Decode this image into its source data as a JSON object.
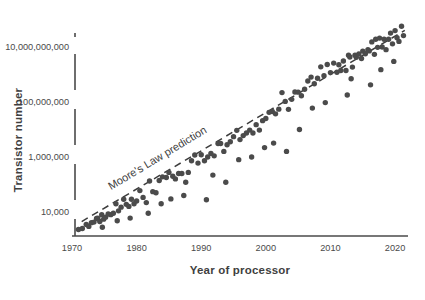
{
  "chart_data": {
    "type": "scatter",
    "title": "",
    "xlabel": "Year of processor",
    "ylabel": "Transistor number",
    "xlim": [
      1970,
      2022
    ],
    "ylim": [
      2000,
      50000000000
    ],
    "yscale": "log",
    "xticks": [
      "1970",
      "1980",
      "1990",
      "2000",
      "2010",
      "2020"
    ],
    "xtick_values": [
      1970,
      1980,
      1990,
      2000,
      2010,
      2020
    ],
    "yticks": [
      "10,000",
      "1,000,000",
      "100,000,000",
      "10,000,000,000"
    ],
    "ytick_values": [
      10000,
      1000000,
      100000000,
      10000000000
    ],
    "grid": false,
    "legend": "none",
    "point_color": "#4b4b4b",
    "point_size": 5.4,
    "annotations": [
      {
        "text": "Moore's Law prediction",
        "x": 1983.5,
        "y": 700000,
        "rotation": -31
      }
    ],
    "series": [
      {
        "name": "Moore's Law prediction",
        "type": "line",
        "style": "dashed",
        "color": "#3c3c3c",
        "x": [
          1971.5,
          2021.5
        ],
        "y": [
          4500,
          40000000000
        ]
      },
      {
        "name": "Processors",
        "type": "scatter",
        "color": "#4b4b4b",
        "points": [
          [
            1971.0,
            2300
          ],
          [
            1971.6,
            2500
          ],
          [
            1972.2,
            3500
          ],
          [
            1972.6,
            3000
          ],
          [
            1973.0,
            4100
          ],
          [
            1973.4,
            4300
          ],
          [
            1973.8,
            5800
          ],
          [
            1974.0,
            6000
          ],
          [
            1974.3,
            4500
          ],
          [
            1974.6,
            8000
          ],
          [
            1974.9,
            5500
          ],
          [
            1975.2,
            6500
          ],
          [
            1975.6,
            8500
          ],
          [
            1976.0,
            8000
          ],
          [
            1976.4,
            9000
          ],
          [
            1976.8,
            20000
          ],
          [
            1977.2,
            11000
          ],
          [
            1977.6,
            15000
          ],
          [
            1978.0,
            29000
          ],
          [
            1978.4,
            19000
          ],
          [
            1978.8,
            16000
          ],
          [
            1979.2,
            29000
          ],
          [
            1979.6,
            20000
          ],
          [
            1980.0,
            25000
          ],
          [
            1980.5,
            60000
          ],
          [
            1981.0,
            34000
          ],
          [
            1981.5,
            22000
          ],
          [
            1982.0,
            134000
          ],
          [
            1982.5,
            55000
          ],
          [
            1983.0,
            50000
          ],
          [
            1983.5,
            140000
          ],
          [
            1984.0,
            190000
          ],
          [
            1984.6,
            180000
          ],
          [
            1985.0,
            275000
          ],
          [
            1985.6,
            200000
          ],
          [
            1986.0,
            160000
          ],
          [
            1986.5,
            250000
          ],
          [
            1987.0,
            250000
          ],
          [
            1987.6,
            120000
          ],
          [
            1988.0,
            275000
          ],
          [
            1988.5,
            730000
          ],
          [
            1989.0,
            1180000
          ],
          [
            1989.5,
            600000
          ],
          [
            1990.0,
            1200000
          ],
          [
            1990.5,
            730000
          ],
          [
            1991.0,
            1000000
          ],
          [
            1991.5,
            1350000
          ],
          [
            1992.0,
            1100000
          ],
          [
            1992.6,
            3100000
          ],
          [
            1993.0,
            3100000
          ],
          [
            1993.5,
            1600000
          ],
          [
            1994.0,
            2800000
          ],
          [
            1994.5,
            3600000
          ],
          [
            1995.0,
            5500000
          ],
          [
            1995.5,
            9300000
          ],
          [
            1996.0,
            4300000
          ],
          [
            1996.5,
            6000000
          ],
          [
            1997.0,
            7500000
          ],
          [
            1997.5,
            9500000
          ],
          [
            1998.0,
            7500000
          ],
          [
            1998.5,
            15000000
          ],
          [
            1999.0,
            9500000
          ],
          [
            1999.5,
            21000000
          ],
          [
            2000.0,
            25000000
          ],
          [
            2000.5,
            42000000
          ],
          [
            2001.0,
            45000000
          ],
          [
            2001.5,
            37000000
          ],
          [
            2002.0,
            55000000
          ],
          [
            2002.5,
            220000000
          ],
          [
            2003.0,
            105000000
          ],
          [
            2003.5,
            54000000
          ],
          [
            2004.0,
            125000000
          ],
          [
            2004.5,
            230000000
          ],
          [
            2005.0,
            228000000
          ],
          [
            2005.5,
            169000000
          ],
          [
            2006.0,
            291000000
          ],
          [
            2006.5,
            582000000
          ],
          [
            2007.0,
            805000000
          ],
          [
            2007.5,
            463000000
          ],
          [
            2008.0,
            731000000
          ],
          [
            2008.5,
            1900000000
          ],
          [
            2009.0,
            904000000
          ],
          [
            2009.5,
            2300000000
          ],
          [
            2010.0,
            1170000000
          ],
          [
            2010.5,
            2600000000
          ],
          [
            2011.0,
            1200000000
          ],
          [
            2011.3,
            2270000000
          ],
          [
            2011.6,
            1400000000
          ],
          [
            2012.0,
            3100000000
          ],
          [
            2012.4,
            1400000000
          ],
          [
            2012.8,
            5000000000
          ],
          [
            2013.0,
            4310000000
          ],
          [
            2013.4,
            1860000000
          ],
          [
            2013.8,
            5000000000
          ],
          [
            2014.0,
            4200000000
          ],
          [
            2014.4,
            5560000000
          ],
          [
            2014.8,
            3800000000
          ],
          [
            2015.0,
            7100000000
          ],
          [
            2015.4,
            5700000000
          ],
          [
            2015.8,
            8000000000
          ],
          [
            2016.0,
            7200000000
          ],
          [
            2016.4,
            15300000000
          ],
          [
            2016.8,
            5400000000
          ],
          [
            2017.0,
            19200000000
          ],
          [
            2017.3,
            9700000000
          ],
          [
            2017.6,
            21100000000
          ],
          [
            2018.0,
            10000000000
          ],
          [
            2018.3,
            19200000000
          ],
          [
            2018.6,
            8000000000
          ],
          [
            2019.0,
            19200000000
          ],
          [
            2019.3,
            32000000000
          ],
          [
            2019.6,
            13000000000
          ],
          [
            2020.0,
            39500000000
          ],
          [
            2020.3,
            21700000000
          ],
          [
            2020.6,
            16000000000
          ],
          [
            2021.0,
            57000000000
          ],
          [
            2021.3,
            26000000000
          ],
          [
            1999.8,
            2200000
          ],
          [
            2003.2,
            1600000
          ],
          [
            2007.2,
            60000000
          ],
          [
            2012.6,
            180000000
          ],
          [
            2016.2,
            420000000
          ],
          [
            1990.8,
            28000
          ],
          [
            1993.8,
            120000
          ],
          [
            1997.8,
            1000000
          ],
          [
            2001.2,
            3200000
          ],
          [
            1985.3,
            30000
          ],
          [
            1981.8,
            9000
          ],
          [
            1977.0,
            4800
          ],
          [
            1974.7,
            2800
          ],
          [
            1979.0,
            6000
          ],
          [
            1983.8,
            20000
          ],
          [
            1987.3,
            40000
          ],
          [
            1991.8,
            220000
          ],
          [
            1995.8,
            800000
          ],
          [
            2005.2,
            10000000
          ],
          [
            2009.2,
            95000000
          ],
          [
            2013.2,
            700000000
          ],
          [
            2017.8,
            1500000000
          ],
          [
            2019.8,
            3000000000
          ]
        ]
      }
    ]
  },
  "axis": {
    "y_title": "Transistor number",
    "x_title": "Year of processor"
  }
}
